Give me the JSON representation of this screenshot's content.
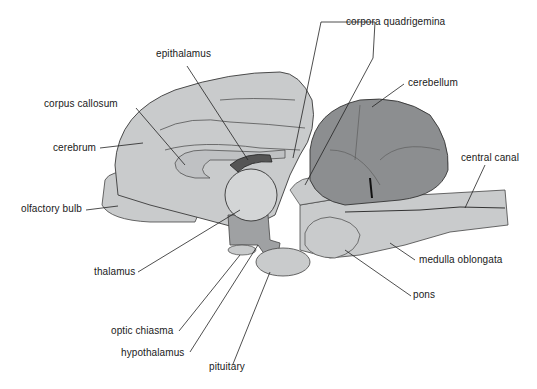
{
  "diagram": {
    "colors": {
      "background": "#ffffff",
      "tissue_light": "#c9cbcc",
      "tissue_mid": "#a9abad",
      "cerebellum": "#8c8e90",
      "outline": "#3a3a3a",
      "text": "#1a1a1a"
    },
    "labels": {
      "corpora_quadrigemina": "corpora quadrigemina",
      "epithalamus": "epithalamus",
      "cerebellum": "cerebellum",
      "corpus_callosum": "corpus callosum",
      "cerebrum": "cerebrum",
      "central_canal": "central canal",
      "olfactory_bulb": "olfactory bulb",
      "thalamus": "thalamus",
      "medulla_oblongata": "medulla oblongata",
      "pons": "pons",
      "optic_chiasma": "optic chiasma",
      "hypothalamus": "hypothalamus",
      "pituitary": "pituitary"
    }
  }
}
